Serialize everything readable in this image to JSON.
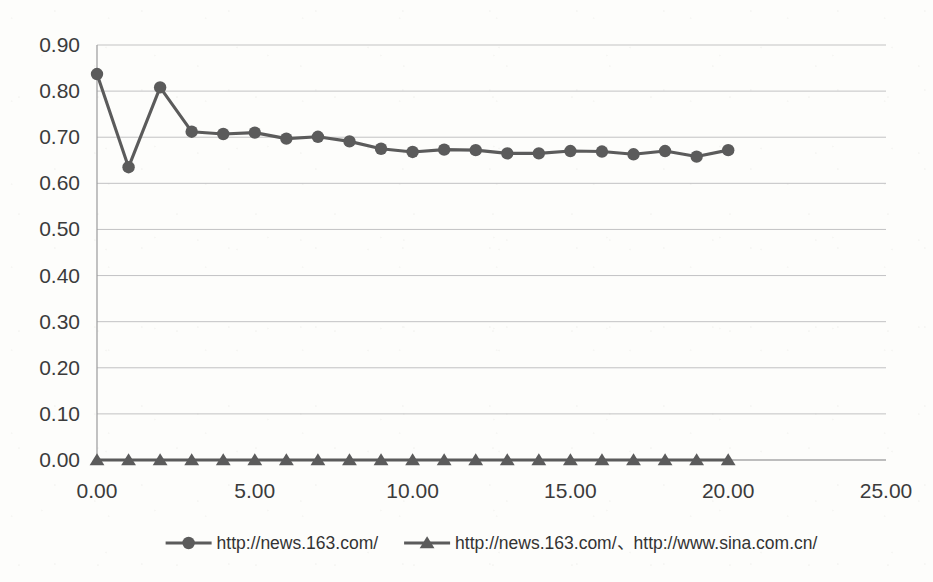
{
  "chart_data": {
    "type": "line",
    "title": "",
    "subtitle": "",
    "xlabel": "",
    "ylabel": "",
    "xlim": [
      0,
      25
    ],
    "ylim": [
      0.0,
      0.9
    ],
    "grid": true,
    "legend_position": "bottom",
    "x_tick_labels": [
      "0.00",
      "5.00",
      "10.00",
      "15.00",
      "20.00",
      "25.00"
    ],
    "x_ticks": [
      0,
      5,
      10,
      15,
      20,
      25
    ],
    "y_tick_labels": [
      "0.00",
      "0.10",
      "0.20",
      "0.30",
      "0.40",
      "0.50",
      "0.60",
      "0.70",
      "0.80",
      "0.90"
    ],
    "y_ticks": [
      0.0,
      0.1,
      0.2,
      0.3,
      0.4,
      0.5,
      0.6,
      0.7,
      0.8,
      0.9
    ],
    "x": [
      0,
      1,
      2,
      3,
      4,
      5,
      6,
      7,
      8,
      9,
      10,
      11,
      12,
      13,
      14,
      15,
      16,
      17,
      18,
      19,
      20
    ],
    "series": [
      {
        "name": "http://news.163.com/",
        "marker": "circle",
        "color": "#5b5b5b",
        "values": [
          0.837,
          0.635,
          0.808,
          0.712,
          0.707,
          0.71,
          0.697,
          0.701,
          0.691,
          0.675,
          0.668,
          0.673,
          0.672,
          0.665,
          0.665,
          0.67,
          0.669,
          0.663,
          0.67,
          0.658,
          0.672
        ]
      },
      {
        "name": "http://news.163.com/、http://www.sina.com.cn/",
        "marker": "triangle",
        "color": "#5b5b5b",
        "values": [
          0.0,
          0.0,
          0.0,
          0.0,
          0.0,
          0.0,
          0.0,
          0.0,
          0.0,
          0.0,
          0.0,
          0.0,
          0.0,
          0.0,
          0.0,
          0.0,
          0.0,
          0.0,
          0.0,
          0.0,
          0.0
        ]
      }
    ]
  },
  "legend": {
    "entries": [
      {
        "label": "http://news.163.com/",
        "marker": "circle-marker",
        "color": "#5b5b5b"
      },
      {
        "label": "http://news.163.com/、http://www.sina.com.cn/",
        "marker": "triangle-marker",
        "color": "#5b5b5b"
      }
    ]
  },
  "colors": {
    "series": "#5b5b5b",
    "gridline": "#b9b9bb",
    "axis": "#9a9a9c",
    "text": "#3b3b3b",
    "background": "#fdfdfb"
  }
}
